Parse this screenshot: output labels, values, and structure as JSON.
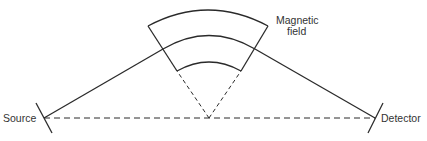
{
  "diagram": {
    "type": "mass-spectrometer-schematic",
    "labels": {
      "source": "Source",
      "detector": "Detector",
      "magnetic_field_line1": "Magnetic",
      "magnetic_field_line2": "field"
    },
    "colors": {
      "stroke": "#2a2a2a",
      "text": "#333333",
      "background": "#ffffff"
    }
  }
}
